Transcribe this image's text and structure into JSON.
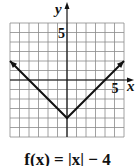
{
  "chart_data": {
    "type": "line",
    "title": "",
    "caption": "f(x) = |x| − 4",
    "xlabel": "x",
    "ylabel": "y",
    "xlim": [
      -6,
      6
    ],
    "ylim": [
      -6,
      6
    ],
    "grid": true,
    "tick_labels": {
      "x": [
        "5"
      ],
      "y": [
        "5"
      ]
    },
    "series": [
      {
        "name": "f(x) = |x| − 4",
        "x": [
          -6,
          0,
          6
        ],
        "y": [
          2,
          -4,
          2
        ],
        "arrows": "both-ends"
      }
    ],
    "colors": {
      "grid": "#8a8a8a",
      "axis": "#111111",
      "line": "#111111"
    }
  }
}
